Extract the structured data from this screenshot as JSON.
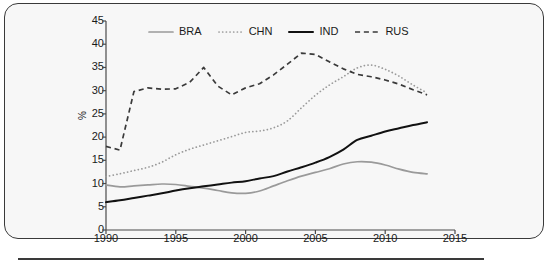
{
  "figure": {
    "ylabel": "%",
    "bottom_rule": true
  },
  "chart_data": {
    "type": "line",
    "title": "",
    "xlabel": "",
    "ylabel": "%",
    "xlim": [
      1990,
      2015
    ],
    "ylim": [
      0,
      45
    ],
    "xticks": [
      1990,
      1995,
      2000,
      2005,
      2010,
      2015
    ],
    "yticks": [
      0,
      5,
      10,
      15,
      20,
      25,
      30,
      35,
      40,
      45
    ],
    "grid": false,
    "legend_position": "top-center",
    "x": [
      1990,
      1991,
      1992,
      1993,
      1994,
      1995,
      1996,
      1997,
      1998,
      1999,
      2000,
      2001,
      2002,
      2003,
      2004,
      2005,
      2006,
      2007,
      2008,
      2009,
      2010,
      2011,
      2012,
      2013
    ],
    "series": [
      {
        "name": "BRA",
        "color": "#9a9a9a",
        "style": "solid",
        "values": [
          9.7,
          9.3,
          9.5,
          9.7,
          9.9,
          9.8,
          9.4,
          9.0,
          8.5,
          8.0,
          7.9,
          8.4,
          9.5,
          10.6,
          11.6,
          12.4,
          13.2,
          14.2,
          14.7,
          14.6,
          14.0,
          13.1,
          12.4,
          12.1
        ]
      },
      {
        "name": "CHN",
        "color": "#9a9a9a",
        "style": "dotted",
        "values": [
          11.5,
          12.1,
          12.8,
          13.5,
          14.6,
          16.2,
          17.4,
          18.3,
          19.2,
          20.1,
          21.0,
          21.3,
          22.0,
          23.5,
          26.3,
          29.0,
          31.2,
          33.0,
          34.9,
          35.5,
          34.6,
          33.1,
          31.2,
          29.5
        ]
      },
      {
        "name": "IND",
        "color": "#111111",
        "style": "solid",
        "values": [
          6.0,
          6.4,
          6.9,
          7.4,
          7.9,
          8.5,
          9.0,
          9.4,
          9.8,
          10.2,
          10.5,
          11.1,
          11.6,
          12.6,
          13.5,
          14.5,
          15.7,
          17.3,
          19.4,
          20.3,
          21.2,
          21.9,
          22.6,
          23.2
        ]
      },
      {
        "name": "RUS",
        "color": "#3a3a3a",
        "style": "dashed",
        "values": [
          18.0,
          17.2,
          29.8,
          30.6,
          30.3,
          30.4,
          31.8,
          35.0,
          31.0,
          29.1,
          30.6,
          31.5,
          33.4,
          35.7,
          38.1,
          37.8,
          36.2,
          34.7,
          33.5,
          33.0,
          32.3,
          31.4,
          30.2,
          29.1
        ]
      }
    ]
  },
  "legend": {
    "items": [
      {
        "label": "BRA"
      },
      {
        "label": "CHN"
      },
      {
        "label": "IND"
      },
      {
        "label": "RUS"
      }
    ]
  }
}
